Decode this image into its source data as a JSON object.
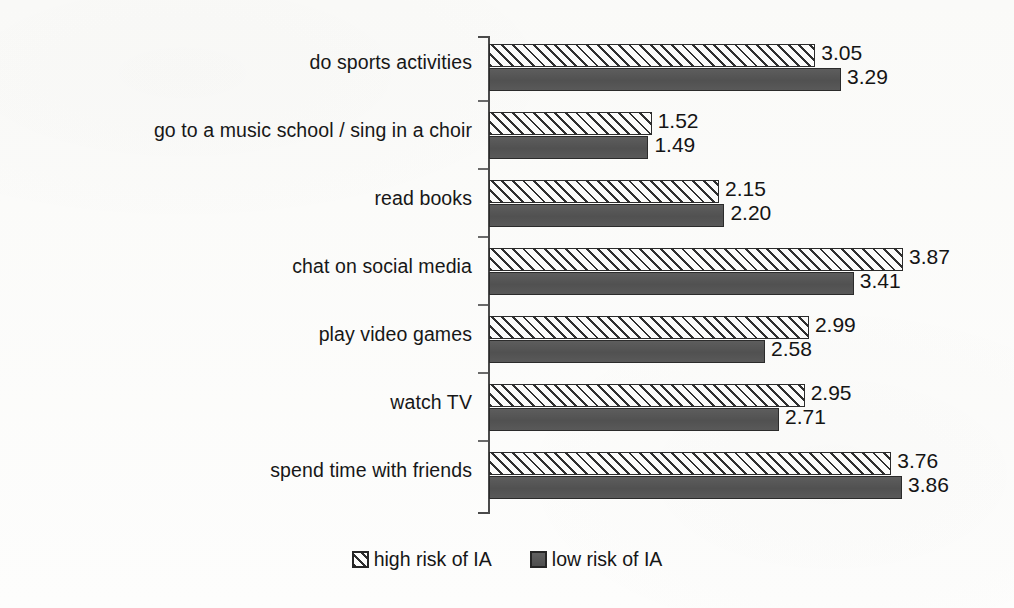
{
  "chart_data": {
    "type": "bar",
    "orientation": "horizontal",
    "grouped": true,
    "title": "",
    "subtitle": "",
    "xlabel": "",
    "ylabel": "",
    "grid": false,
    "xlim": [
      0,
      4
    ],
    "axis_ticks_visible": true,
    "legend_position": "bottom",
    "value_label_precision": 2,
    "categories": [
      "do sports activities",
      "go to a music school / sing in a choir",
      "read books",
      "chat on social media",
      "play video games",
      "watch TV",
      "spend time with friends"
    ],
    "series": [
      {
        "name": "high risk of IA",
        "pattern": "diagonal-hatch",
        "color": "#fbfbfa",
        "hatch_color": "#2f2f2f",
        "border_color": "#2b2b2b",
        "values": [
          3.05,
          1.52,
          2.15,
          3.87,
          2.99,
          2.95,
          3.76
        ],
        "value_labels": [
          "3.05",
          "1.52",
          "2.15",
          "3.87",
          "2.99",
          "2.95",
          "3.76"
        ]
      },
      {
        "name": "low risk of IA",
        "pattern": "solid",
        "color": "#575757",
        "border_color": "#2b2b2b",
        "values": [
          3.29,
          1.49,
          2.2,
          3.41,
          2.58,
          2.71,
          3.86
        ],
        "value_labels": [
          "3.29",
          "1.49",
          "2.20",
          "3.41",
          "2.58",
          "2.71",
          "3.86"
        ]
      }
    ]
  },
  "legend": {
    "items": [
      {
        "label": "high risk of IA",
        "style": "high"
      },
      {
        "label": "low risk of IA",
        "style": "low"
      }
    ]
  }
}
